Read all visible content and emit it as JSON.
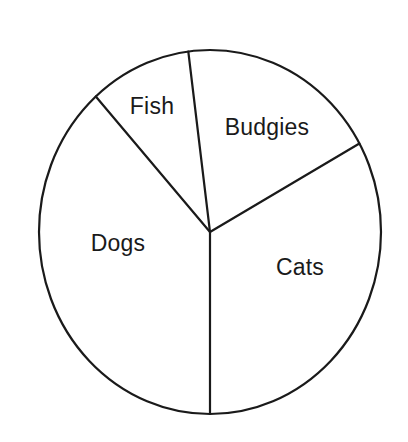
{
  "chart_data": {
    "type": "pie",
    "title": "",
    "subtitle": "",
    "xlabel": "",
    "ylabel": "",
    "grid": false,
    "legend": "none",
    "labels_position": "inside-slice",
    "style": {
      "fill": "#ffffff",
      "stroke": "#1a1a1a",
      "background": "#ffffff",
      "stroke_width": 2.2,
      "label_color": "#1a1a1a"
    },
    "geometry": {
      "center_x": 210,
      "center_y": 232,
      "radius_x": 171,
      "radius_y": 182,
      "start_angle_deg": 97.3,
      "direction": "clockwise"
    },
    "categories": [
      "Budgies",
      "Cats",
      "Dogs",
      "Fish"
    ],
    "values": [
      68,
      119,
      138,
      35
    ],
    "slices": [
      {
        "label": "Budgies",
        "angle_deg": 68,
        "percent": 18.9,
        "start_deg": 97.3,
        "end_deg": 29.1,
        "label_x": 267,
        "label_y": 127
      },
      {
        "label": "Cats",
        "angle_deg": 119,
        "percent": 33.1,
        "start_deg": 29.1,
        "end_deg": -90,
        "label_x": 300,
        "label_y": 267
      },
      {
        "label": "Dogs",
        "angle_deg": 138,
        "percent": 38.3,
        "start_deg": -90,
        "end_deg": 131.9,
        "label_x": 118,
        "label_y": 243
      },
      {
        "label": "Fish",
        "angle_deg": 35,
        "percent": 9.7,
        "start_deg": 131.9,
        "end_deg": 97.3,
        "label_x": 152,
        "label_y": 106
      }
    ]
  }
}
